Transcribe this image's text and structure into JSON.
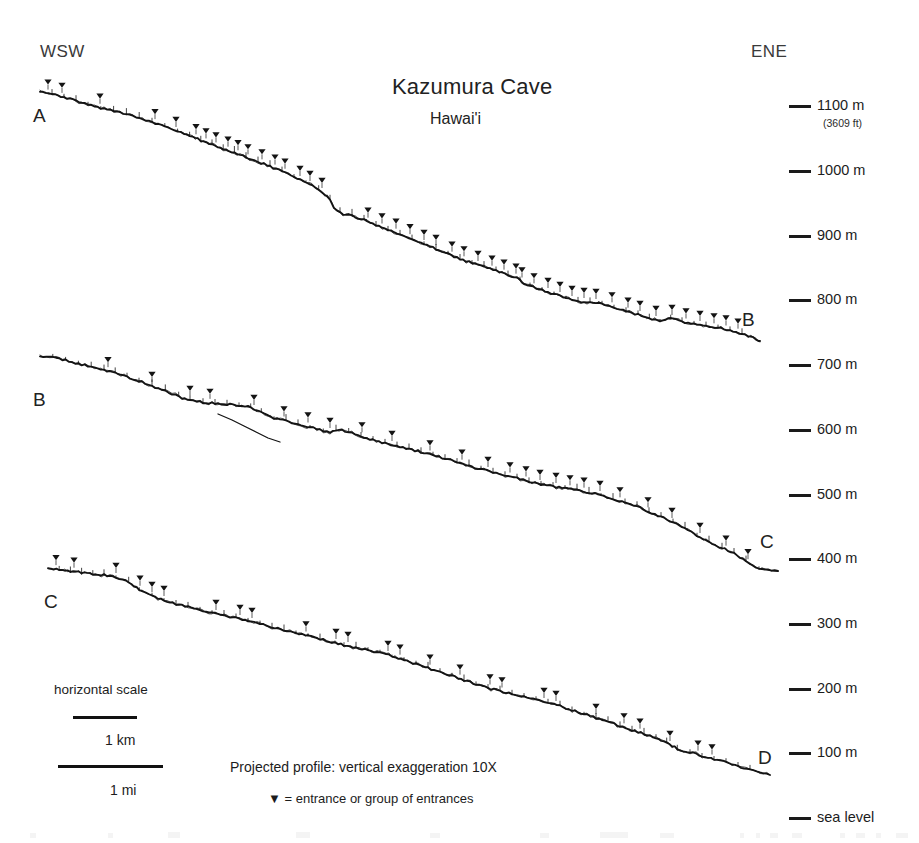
{
  "figure": {
    "title": "Kazumura Cave",
    "subtitle": "Hawai'i",
    "compass_left": "WSW",
    "compass_right": "ENE",
    "note": "Projected profile: vertical exaggeration 10X",
    "legend_note": "▼ = entrance or group of entrances",
    "entrance_marker_glyph": "▼",
    "line_color": "#141414",
    "background_color": "#ffffff"
  },
  "segment_labels": [
    {
      "text": "A",
      "x": 33,
      "y": 106
    },
    {
      "text": "B",
      "x": 742,
      "y": 310
    },
    {
      "text": "B",
      "x": 33,
      "y": 390
    },
    {
      "text": "C",
      "x": 760,
      "y": 532
    },
    {
      "text": "C",
      "x": 44,
      "y": 592
    },
    {
      "text": "D",
      "x": 758,
      "y": 748
    }
  ],
  "elevation_axis": {
    "tick_x": 789,
    "tick_width": 22,
    "label_x": 817,
    "units": "m",
    "ticks": [
      {
        "label": "1100 m",
        "value": 1100,
        "y": 98,
        "sublabel": "(3609 ft)"
      },
      {
        "label": "1000 m",
        "value": 1000,
        "y": 163,
        "sublabel": ""
      },
      {
        "label": "900 m",
        "value": 900,
        "y": 228,
        "sublabel": ""
      },
      {
        "label": "800 m",
        "value": 800,
        "y": 292,
        "sublabel": ""
      },
      {
        "label": "700 m",
        "value": 700,
        "y": 357,
        "sublabel": ""
      },
      {
        "label": "600 m",
        "value": 600,
        "y": 422,
        "sublabel": ""
      },
      {
        "label": "500 m",
        "value": 500,
        "y": 487,
        "sublabel": ""
      },
      {
        "label": "400 m",
        "value": 400,
        "y": 551,
        "sublabel": ""
      },
      {
        "label": "300 m",
        "value": 300,
        "y": 616,
        "sublabel": ""
      },
      {
        "label": "200 m",
        "value": 200,
        "y": 681,
        "sublabel": ""
      },
      {
        "label": "100 m",
        "value": 100,
        "y": 745,
        "sublabel": ""
      },
      {
        "label": "sea level",
        "value": 0,
        "y": 810,
        "sublabel": ""
      }
    ]
  },
  "scale_bars": {
    "title": "horizontal scale",
    "title_x": 54,
    "title_y": 683,
    "bars": [
      {
        "label": "1 km",
        "x": 73,
        "y": 716,
        "width": 64,
        "label_x": 105,
        "label_y": 733
      },
      {
        "label": "1 mi",
        "x": 58,
        "y": 765,
        "width": 105,
        "label_x": 110,
        "label_y": 783
      }
    ]
  },
  "annotations": {
    "note_x": 230,
    "note_y": 760,
    "legend_x": 268,
    "legend_y": 792
  },
  "chart_data": {
    "type": "line",
    "title": "Kazumura Cave",
    "subtitle": "Hawai'i",
    "xlabel": "",
    "ylabel": "Elevation (m)",
    "grid": false,
    "legend_position": "bottom",
    "ylim": [
      0,
      1150
    ],
    "yticks": [
      0,
      100,
      200,
      300,
      400,
      500,
      600,
      700,
      800,
      900,
      1100
    ],
    "ytick_labels": [
      "sea level",
      "100 m",
      "200 m",
      "300 m",
      "400 m",
      "500 m",
      "600 m",
      "700 m",
      "800 m",
      "900 m",
      "1100 m"
    ],
    "vertical_exaggeration": "10X",
    "series": [
      {
        "name": "Segment A-B",
        "start_label": "A",
        "end_label": "B",
        "start_elevation_m": 1110,
        "end_elevation_m": 700,
        "points": [
          [
            40,
            92
          ],
          [
            55,
            95
          ],
          [
            70,
            99
          ],
          [
            88,
            104
          ],
          [
            104,
            109
          ],
          [
            120,
            112
          ],
          [
            136,
            117
          ],
          [
            152,
            122
          ],
          [
            168,
            128
          ],
          [
            184,
            134
          ],
          [
            198,
            139
          ],
          [
            212,
            145
          ],
          [
            226,
            150
          ],
          [
            240,
            155
          ],
          [
            252,
            160
          ],
          [
            264,
            164
          ],
          [
            276,
            169
          ],
          [
            288,
            174
          ],
          [
            300,
            180
          ],
          [
            312,
            186
          ],
          [
            322,
            192
          ],
          [
            330,
            200
          ],
          [
            334,
            208
          ],
          [
            340,
            213
          ],
          [
            352,
            216
          ],
          [
            364,
            220
          ],
          [
            376,
            225
          ],
          [
            388,
            230
          ],
          [
            400,
            234
          ],
          [
            412,
            239
          ],
          [
            424,
            244
          ],
          [
            436,
            249
          ],
          [
            448,
            254
          ],
          [
            460,
            259
          ],
          [
            472,
            263
          ],
          [
            484,
            267
          ],
          [
            496,
            271
          ],
          [
            508,
            275
          ],
          [
            520,
            279
          ],
          [
            524,
            284
          ],
          [
            536,
            288
          ],
          [
            548,
            292
          ],
          [
            560,
            296
          ],
          [
            572,
            300
          ],
          [
            584,
            302
          ],
          [
            596,
            303
          ],
          [
            608,
            305
          ],
          [
            620,
            309
          ],
          [
            632,
            313
          ],
          [
            644,
            316
          ],
          [
            652,
            319
          ],
          [
            660,
            321
          ],
          [
            668,
            318
          ],
          [
            676,
            320
          ],
          [
            688,
            323
          ],
          [
            700,
            325
          ],
          [
            712,
            327
          ],
          [
            724,
            329
          ],
          [
            736,
            332
          ],
          [
            748,
            336
          ],
          [
            756,
            339
          ],
          [
            760,
            341
          ]
        ],
        "entrances_x": [
          48,
          62,
          100,
          155,
          176,
          196,
          206,
          216,
          228,
          238,
          248,
          262,
          275,
          285,
          300,
          310,
          322,
          368,
          382,
          396,
          410,
          424,
          436,
          452,
          464,
          478,
          492,
          504,
          516,
          522,
          534,
          548,
          560,
          572,
          584,
          596,
          612,
          628,
          640,
          656,
          672,
          686,
          700,
          714,
          726,
          738
        ]
      },
      {
        "name": "Segment B-C",
        "start_label": "B",
        "end_label": "C",
        "start_elevation_m": 700,
        "end_elevation_m": 400,
        "points": [
          [
            40,
            356
          ],
          [
            56,
            358
          ],
          [
            72,
            362
          ],
          [
            88,
            366
          ],
          [
            104,
            370
          ],
          [
            118,
            374
          ],
          [
            130,
            378
          ],
          [
            142,
            382
          ],
          [
            152,
            386
          ],
          [
            162,
            390
          ],
          [
            172,
            394
          ],
          [
            182,
            398
          ],
          [
            190,
            400
          ],
          [
            200,
            402
          ],
          [
            212,
            403
          ],
          [
            224,
            404
          ],
          [
            236,
            405
          ],
          [
            248,
            406
          ],
          [
            256,
            410
          ],
          [
            264,
            414
          ],
          [
            274,
            418
          ],
          [
            286,
            421
          ],
          [
            298,
            424
          ],
          [
            310,
            427
          ],
          [
            320,
            430
          ],
          [
            330,
            432
          ],
          [
            342,
            430
          ],
          [
            352,
            433
          ],
          [
            364,
            437
          ],
          [
            376,
            441
          ],
          [
            388,
            444
          ],
          [
            400,
            447
          ],
          [
            412,
            450
          ],
          [
            424,
            453
          ],
          [
            436,
            456
          ],
          [
            448,
            459
          ],
          [
            460,
            463
          ],
          [
            472,
            467
          ],
          [
            484,
            470
          ],
          [
            496,
            473
          ],
          [
            508,
            476
          ],
          [
            520,
            479
          ],
          [
            532,
            482
          ],
          [
            544,
            485
          ],
          [
            556,
            487
          ],
          [
            568,
            489
          ],
          [
            580,
            491
          ],
          [
            592,
            493
          ],
          [
            604,
            496
          ],
          [
            616,
            500
          ],
          [
            628,
            504
          ],
          [
            640,
            508
          ],
          [
            652,
            513
          ],
          [
            664,
            518
          ],
          [
            676,
            524
          ],
          [
            688,
            530
          ],
          [
            700,
            537
          ],
          [
            712,
            543
          ],
          [
            722,
            548
          ],
          [
            734,
            553
          ],
          [
            746,
            562
          ],
          [
            756,
            568
          ],
          [
            768,
            570
          ],
          [
            778,
            571
          ]
        ],
        "entrances_x": [
          108,
          152,
          190,
          210,
          254,
          284,
          308,
          330,
          362,
          392,
          430,
          462,
          488,
          510,
          526,
          540,
          556,
          570,
          584,
          600,
          620,
          648,
          672,
          700,
          726,
          748
        ],
        "branch_points": [
          [
            218,
            414
          ],
          [
            232,
            420
          ],
          [
            244,
            426
          ],
          [
            256,
            432
          ],
          [
            268,
            438
          ],
          [
            280,
            442
          ]
        ]
      },
      {
        "name": "Segment C-D",
        "start_label": "C",
        "end_label": "D",
        "start_elevation_m": 400,
        "end_elevation_m": 60,
        "points": [
          [
            48,
            568
          ],
          [
            62,
            570
          ],
          [
            76,
            572
          ],
          [
            90,
            574
          ],
          [
            104,
            575
          ],
          [
            116,
            577
          ],
          [
            126,
            581
          ],
          [
            134,
            586
          ],
          [
            142,
            591
          ],
          [
            152,
            596
          ],
          [
            164,
            600
          ],
          [
            176,
            604
          ],
          [
            188,
            607
          ],
          [
            200,
            610
          ],
          [
            212,
            613
          ],
          [
            224,
            616
          ],
          [
            236,
            618
          ],
          [
            248,
            621
          ],
          [
            260,
            624
          ],
          [
            272,
            627
          ],
          [
            284,
            630
          ],
          [
            296,
            633
          ],
          [
            308,
            636
          ],
          [
            320,
            639
          ],
          [
            332,
            642
          ],
          [
            344,
            645
          ],
          [
            356,
            648
          ],
          [
            368,
            650
          ],
          [
            380,
            653
          ],
          [
            392,
            656
          ],
          [
            404,
            660
          ],
          [
            416,
            664
          ],
          [
            428,
            668
          ],
          [
            440,
            672
          ],
          [
            452,
            676
          ],
          [
            464,
            680
          ],
          [
            476,
            684
          ],
          [
            488,
            688
          ],
          [
            500,
            691
          ],
          [
            512,
            694
          ],
          [
            524,
            697
          ],
          [
            536,
            700
          ],
          [
            548,
            703
          ],
          [
            560,
            706
          ],
          [
            572,
            710
          ],
          [
            584,
            714
          ],
          [
            596,
            718
          ],
          [
            608,
            722
          ],
          [
            620,
            726
          ],
          [
            632,
            730
          ],
          [
            644,
            734
          ],
          [
            656,
            738
          ],
          [
            664,
            742
          ],
          [
            672,
            746
          ],
          [
            680,
            750
          ],
          [
            690,
            752
          ],
          [
            702,
            756
          ],
          [
            714,
            759
          ],
          [
            726,
            762
          ],
          [
            738,
            766
          ],
          [
            750,
            770
          ],
          [
            760,
            773
          ],
          [
            770,
            775
          ]
        ],
        "entrances_x": [
          56,
          74,
          116,
          140,
          152,
          164,
          216,
          240,
          252,
          306,
          336,
          348,
          388,
          400,
          430,
          460,
          490,
          502,
          544,
          556,
          596,
          624,
          640,
          670,
          698,
          712
        ]
      }
    ]
  }
}
